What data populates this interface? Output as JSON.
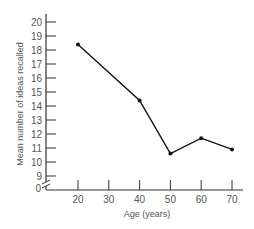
{
  "chart_data": {
    "type": "line",
    "title": "",
    "xlabel": "Age (years)",
    "ylabel": "Mean number of ideas recalled",
    "x": [
      20,
      30,
      40,
      50,
      60,
      70
    ],
    "x_ticks": [
      20,
      30,
      40,
      50,
      60,
      70
    ],
    "y_ticks": [
      9,
      10,
      11,
      12,
      13,
      14,
      15,
      16,
      17,
      18,
      19,
      20
    ],
    "y_zero_label": "0",
    "axis_break": true,
    "xlim": [
      13,
      74
    ],
    "ylim": [
      8,
      21
    ],
    "grid": false,
    "series": [
      {
        "name": "Mean ideas recalled",
        "x": [
          20,
          40,
          50,
          60,
          70
        ],
        "values": [
          18.4,
          14.4,
          10.6,
          11.7,
          10.9
        ],
        "color": "#111111"
      }
    ]
  }
}
